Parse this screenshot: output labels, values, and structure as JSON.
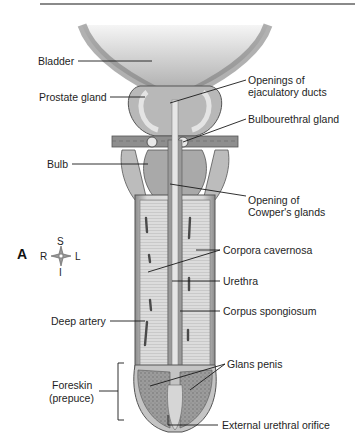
{
  "figure": {
    "panel_letter": "A",
    "orientation": {
      "superior": "S",
      "inferior": "I",
      "right": "R",
      "left": "L"
    },
    "labels": {
      "bladder": "Bladder",
      "prostate": "Prostate gland",
      "ejac_line1": "Openings of",
      "ejac_line2": "ejaculatory ducts",
      "bulbourethral": "Bulbourethral gland",
      "bulb": "Bulb",
      "cowper_line1": "Opening of",
      "cowper_line2": "Cowper's glands",
      "cavernosa": "Corpora cavernosa",
      "urethra": "Urethra",
      "spongiosum": "Corpus spongiosum",
      "deep_artery": "Deep artery",
      "glans": "Glans penis",
      "foreskin_line1": "Foreskin",
      "foreskin_line2": "(prepuce)",
      "orifice": "External urethral orifice"
    },
    "colors": {
      "tissue_light": "#d9d9d9",
      "tissue_mid": "#a9a9a9",
      "tissue_dark": "#6e6e6e",
      "line": "#1a1a1a"
    }
  }
}
